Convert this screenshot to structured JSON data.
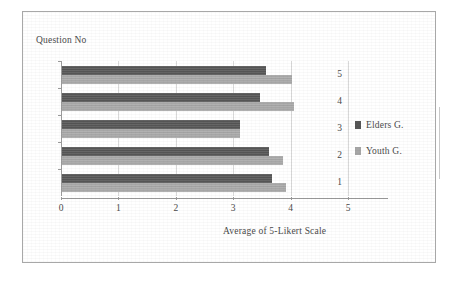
{
  "chart_data": {
    "type": "bar",
    "orientation": "horizontal",
    "title": "",
    "xlabel": "Average of 5-Likert Scale",
    "ylabel": "Question No",
    "categories": [
      "1",
      "2",
      "3",
      "4",
      "5"
    ],
    "display_order": [
      "5",
      "4",
      "3",
      "2",
      "1"
    ],
    "xlim": [
      0,
      5
    ],
    "xticks": [
      "0",
      "1",
      "2",
      "3",
      "4",
      "5"
    ],
    "grid": true,
    "legend_position": "right",
    "series": [
      {
        "name": "Elders G.",
        "color": "#555555",
        "values": [
          3.65,
          3.6,
          3.1,
          3.45,
          3.55
        ]
      },
      {
        "name": "Youth G.",
        "color": "#a6a6a6",
        "values": [
          3.9,
          3.85,
          3.1,
          4.05,
          4.0
        ]
      }
    ]
  },
  "legend": {
    "items": [
      {
        "label": "Elders G.",
        "swatch": "#555555"
      },
      {
        "label": "Youth G.",
        "swatch": "#a6a6a6"
      }
    ]
  }
}
